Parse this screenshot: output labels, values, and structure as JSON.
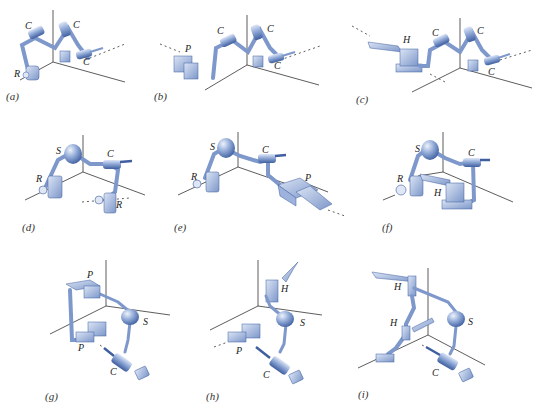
{
  "figure": {
    "joint_legend": {
      "C": "cylindrical joint",
      "R": "revolute joint",
      "P": "prismatic joint",
      "H": "helical joint",
      "S": "spherical joint"
    },
    "colors": {
      "link": "#8fa8d6",
      "link_dark": "#4a69a8",
      "joint_light": "#c9d6f0",
      "axis": "#333333"
    },
    "panels": [
      {
        "id": "a",
        "caption": "(a)",
        "joints": [
          "R",
          "C",
          "C",
          "C"
        ]
      },
      {
        "id": "b",
        "caption": "(b)",
        "joints": [
          "P",
          "C",
          "C",
          "C"
        ]
      },
      {
        "id": "c",
        "caption": "(c)",
        "joints": [
          "H",
          "C",
          "C",
          "C"
        ]
      },
      {
        "id": "d",
        "caption": "(d)",
        "joints": [
          "R",
          "S",
          "C",
          "R"
        ]
      },
      {
        "id": "e",
        "caption": "(e)",
        "joints": [
          "R",
          "S",
          "C",
          "P"
        ]
      },
      {
        "id": "f",
        "caption": "(f)",
        "joints": [
          "R",
          "S",
          "C",
          "H"
        ]
      },
      {
        "id": "g",
        "caption": "(g)",
        "joints": [
          "P",
          "P",
          "S",
          "C"
        ]
      },
      {
        "id": "h",
        "caption": "(h)",
        "joints": [
          "H",
          "P",
          "S",
          "C"
        ]
      },
      {
        "id": "i",
        "caption": "(i)",
        "joints": [
          "H",
          "H",
          "S",
          "C"
        ]
      }
    ]
  }
}
